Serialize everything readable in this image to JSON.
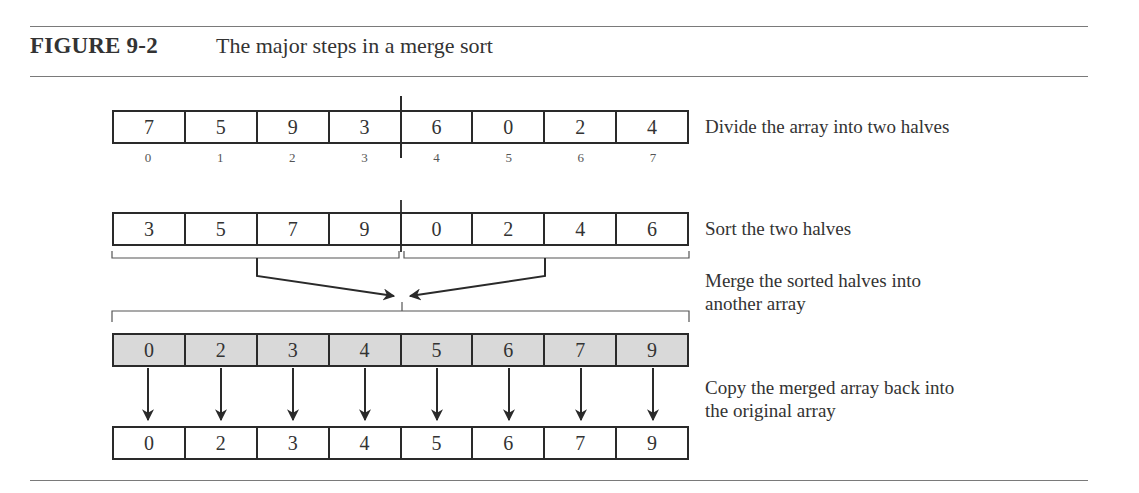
{
  "figure": {
    "label": "FIGURE 9-2",
    "title": "The major steps in a merge sort"
  },
  "steps": [
    {
      "name": "divide",
      "description": "Divide the array into two halves",
      "array": [
        "7",
        "5",
        "9",
        "3",
        "6",
        "0",
        "2",
        "4"
      ],
      "indices": [
        "0",
        "1",
        "2",
        "3",
        "4",
        "5",
        "6",
        "7"
      ]
    },
    {
      "name": "sort-halves",
      "description": "Sort the two halves",
      "array": [
        "3",
        "5",
        "7",
        "9",
        "0",
        "2",
        "4",
        "6"
      ]
    },
    {
      "name": "merge",
      "description_line1": "Merge the sorted halves into",
      "description_line2": "another array",
      "array": [
        "0",
        "2",
        "3",
        "4",
        "5",
        "6",
        "7",
        "9"
      ]
    },
    {
      "name": "copy-back",
      "description_line1": "Copy the merged array back into",
      "description_line2": "the original array",
      "array": [
        "0",
        "2",
        "3",
        "4",
        "5",
        "6",
        "7",
        "9"
      ]
    }
  ],
  "colors": {
    "ink": "#2a2a2a",
    "merged_fill": "#d9d9d9",
    "rule": "#7a7a7a"
  }
}
